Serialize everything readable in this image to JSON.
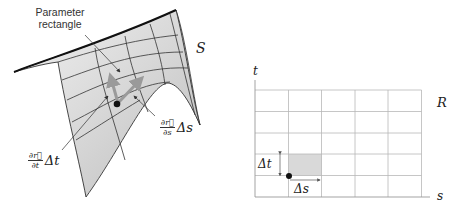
{
  "surface_panel": {
    "surface_label": "S",
    "callout_label_line1": "Parameter",
    "callout_label_line2": "rectangle",
    "vector_t_label": {
      "numerator": "∂r⃗",
      "denominator": "∂t",
      "factor": "Δt"
    },
    "vector_s_label": {
      "numerator": "∂r⃗",
      "denominator": "∂s",
      "factor": "Δs"
    },
    "colors": {
      "surface_fill": "#d6d6d6",
      "surface_edge": "#333333",
      "vector": "#9a9a9a",
      "point": "#111111"
    }
  },
  "domain_panel": {
    "region_label": "R",
    "x_axis_label": "s",
    "y_axis_label": "t",
    "grid_columns": 5,
    "grid_rows": 5,
    "shaded_cell": {
      "column": 1,
      "row_from_bottom": 1
    },
    "delta_t_label": "Δt",
    "delta_s_label": "Δs",
    "colors": {
      "grid": "#b8b8b8",
      "shade": "#d9d9d9",
      "point": "#111111"
    }
  }
}
